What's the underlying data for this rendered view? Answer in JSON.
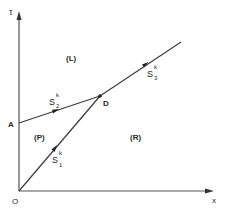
{
  "diagram": {
    "axes": {
      "y_label": "τ",
      "x_label": "x",
      "origin_label": "O"
    },
    "points": {
      "A": "A",
      "D": "D"
    },
    "regions": {
      "left": "(L)",
      "pocket": "(P)",
      "right": "(R)"
    },
    "curves": [
      {
        "name": "S",
        "sub": "1",
        "sup": "k",
        "from": "O",
        "to": "D"
      },
      {
        "name": "S",
        "sub": "2",
        "sup": "k",
        "from": "A",
        "to": "D"
      },
      {
        "name": "S",
        "sub": "3",
        "sup": "k",
        "from": "D",
        "to": "beyond"
      }
    ],
    "colors": {
      "line": "#3a3a3a",
      "text": "#2a2a2a",
      "background": "#ffffff"
    }
  }
}
